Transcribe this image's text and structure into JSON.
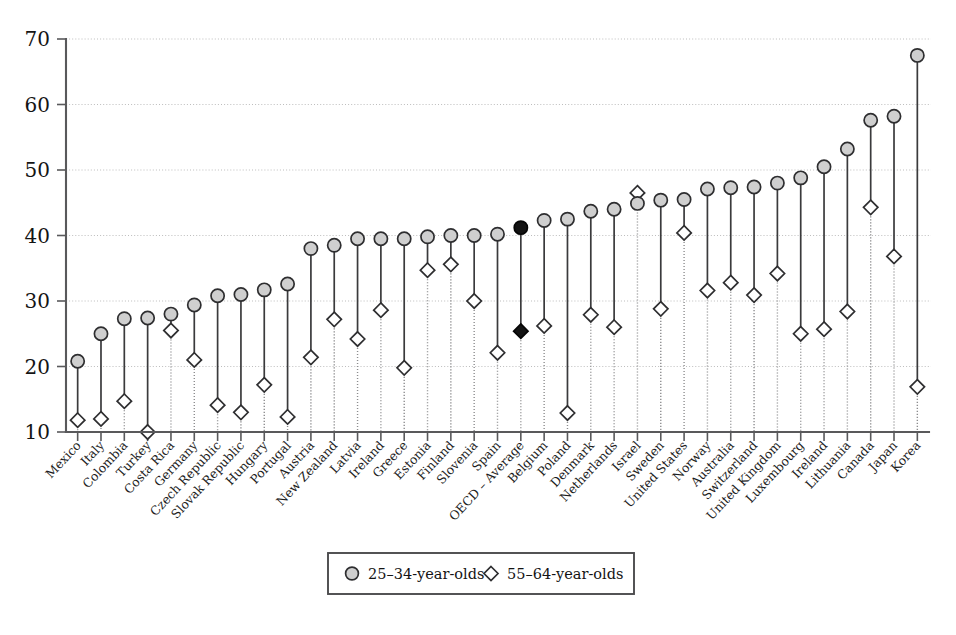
{
  "chart_data": {
    "type": "scatter",
    "title": "",
    "subtitle": "",
    "xlabel": "",
    "ylabel": "",
    "ylim": [
      10,
      70
    ],
    "yticks": [
      10,
      20,
      30,
      40,
      50,
      60,
      70
    ],
    "grid": true,
    "legend_position": "bottom-center",
    "highlight_category": "OECD – Average",
    "categories": [
      "Mexico",
      "Italy",
      "Colombia",
      "Turkey",
      "Costa Rica",
      "Germany",
      "Czech Republic",
      "Slovak Republic",
      "Hungary",
      "Portugal",
      "Austria",
      "New Zealand",
      "Latvia",
      "Ireland",
      "Greece",
      "Estonia",
      "Finland",
      "Slovenia",
      "Spain",
      "OECD – Average",
      "Belgium",
      "Poland",
      "Denmark",
      "Netherlands",
      "Israel",
      "Sweden",
      "United States",
      "Norway",
      "Australia",
      "Switzerland",
      "United Kingdom",
      "Luxembourg",
      "Ireland",
      "Lithuania",
      "Canada",
      "Japan",
      "Korea"
    ],
    "series": [
      {
        "name": "25–34-year-olds",
        "marker": "circle",
        "values": [
          20.8,
          25.0,
          27.3,
          27.4,
          28.0,
          29.4,
          30.8,
          31.0,
          31.7,
          32.6,
          38.0,
          38.5,
          39.5,
          39.5,
          39.5,
          39.8,
          40.0,
          40.0,
          40.2,
          41.2,
          42.3,
          42.5,
          43.7,
          44.0,
          44.9,
          45.4,
          45.5,
          47.1,
          47.3,
          47.4,
          48.0,
          48.8,
          50.5,
          53.2,
          57.6,
          58.2,
          67.5
        ]
      },
      {
        "name": "55–64-year-olds",
        "marker": "diamond",
        "values": [
          11.8,
          12.0,
          14.7,
          10.0,
          25.5,
          21.0,
          14.1,
          13.0,
          17.2,
          12.3,
          21.4,
          27.2,
          24.2,
          28.6,
          19.8,
          34.7,
          35.6,
          30.0,
          22.1,
          25.4,
          26.2,
          12.9,
          27.9,
          26.0,
          46.5,
          28.8,
          40.4,
          31.6,
          32.8,
          30.9,
          34.2,
          25.0,
          25.7,
          28.4,
          44.3,
          36.8,
          16.9
        ]
      }
    ]
  },
  "legend": {
    "items": [
      {
        "label": "25–34-year-olds",
        "marker": "circle"
      },
      {
        "label": "55–64-year-olds",
        "marker": "diamond"
      }
    ]
  }
}
